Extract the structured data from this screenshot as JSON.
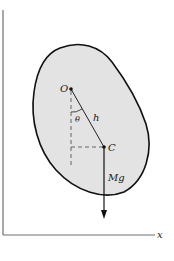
{
  "figure": {
    "axes": {
      "x_label": "x",
      "y_label": "",
      "color": "#6e6e6e"
    },
    "body": {
      "fill": "#e3e3e3",
      "stroke": "#111111"
    },
    "points": {
      "pivot_label": "O",
      "center_of_mass_label": "C"
    },
    "labels": {
      "angle": "θ",
      "distance": "h",
      "weight": "Mg"
    },
    "guide_line_color": "#555555"
  }
}
